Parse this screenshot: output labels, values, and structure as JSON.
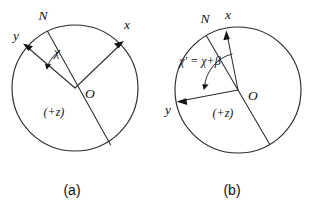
{
  "figure": {
    "background_color": "#ffffff",
    "line_color": "#2b2b2b",
    "text_color": "#111111",
    "panels": [
      {
        "key": "a",
        "caption": "(a)",
        "labels": {
          "north": "N",
          "x_axis": "x",
          "y_axis": "y",
          "origin": "O",
          "z_axis": "(+z)",
          "angle": "χ"
        }
      },
      {
        "key": "b",
        "caption": "(b)",
        "labels": {
          "north": "N",
          "x_axis": "x",
          "y_axis": "y",
          "origin": "O",
          "z_axis": "(+z)",
          "angle": "χ' = χ+β"
        }
      }
    ]
  }
}
